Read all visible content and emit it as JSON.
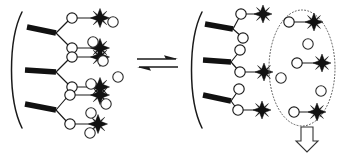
{
  "figure": {
    "colors": {
      "ink": "#111111",
      "outline": "#1a1a1a",
      "dotted": "#555555",
      "background": "#ffffff"
    }
  },
  "left_panel": {
    "name": "bound-state-complex",
    "membrane": {
      "label": "cell-membrane-arc",
      "x": 16,
      "top_y": 12,
      "bottom_y": 128,
      "bow": 14
    },
    "antibodies": [
      {
        "label": "antibody-left-1",
        "hinge_x": 56,
        "hinge_y": 33,
        "stem_x": 27,
        "stem_y": 27,
        "arms": [
          {
            "cx": 72,
            "cy": 18,
            "bound": true,
            "star_cx": 100,
            "star_cy": 18
          },
          {
            "cx": 72,
            "cy": 48,
            "bound": true,
            "star_cx": 100,
            "star_cy": 48
          }
        ]
      },
      {
        "label": "antibody-left-2",
        "hinge_x": 56,
        "hinge_y": 72,
        "stem_x": 25,
        "stem_y": 70,
        "arms": [
          {
            "cx": 72,
            "cy": 57,
            "bound": true,
            "star_cx": 100,
            "star_cy": 57
          },
          {
            "cx": 72,
            "cy": 87,
            "bound": true,
            "star_cx": 100,
            "star_cy": 87
          }
        ]
      },
      {
        "label": "antibody-left-3",
        "hinge_x": 56,
        "hinge_y": 110,
        "stem_x": 25,
        "stem_y": 104,
        "arms": [
          {
            "cx": 70,
            "cy": 95,
            "bound": true,
            "star_cx": 100,
            "star_cy": 95
          },
          {
            "cx": 70,
            "cy": 124,
            "bound": true,
            "star_cx": 98,
            "star_cy": 124
          }
        ]
      }
    ],
    "free_antigens": [
      {
        "cx": 111,
        "cy": 22,
        "r": 5
      },
      {
        "cx": 92,
        "cy": 42,
        "r": 5
      },
      {
        "cx": 101,
        "cy": 60,
        "r": 5
      },
      {
        "cx": 116,
        "cy": 76,
        "r": 5
      },
      {
        "cx": 90,
        "cy": 85,
        "r": 5
      },
      {
        "cx": 104,
        "cy": 103,
        "r": 5
      },
      {
        "cx": 90,
        "cy": 112,
        "r": 5
      },
      {
        "cx": 88,
        "cy": 115,
        "r": 5
      }
    ],
    "bound_count": 6,
    "free_count": 8
  },
  "equilibrium": {
    "name": "equilibrium-arrows",
    "x_start": 137,
    "x_end": 178,
    "top_y": 59,
    "bottom_y": 67,
    "forward_direction": "right",
    "reverse_direction": "left"
  },
  "right_panel": {
    "name": "released-state-complex",
    "membrane": {
      "label": "cell-membrane-arc",
      "x": 196,
      "top_y": 12,
      "bottom_y": 128,
      "bow": 14
    },
    "antibodies": [
      {
        "label": "antibody-right-1",
        "hinge_x": 233,
        "hinge_y": 29,
        "stem_x": 205,
        "stem_y": 24,
        "arms": [
          {
            "cx": 241,
            "cy": 14,
            "bound": true,
            "star_cx": 263,
            "star_cy": 14
          },
          {
            "cx": 243,
            "cy": 38,
            "bound": false
          }
        ]
      },
      {
        "label": "antibody-right-2",
        "hinge_x": 231,
        "hinge_y": 62,
        "stem_x": 203,
        "stem_y": 60,
        "arms": [
          {
            "cx": 240,
            "cy": 50,
            "bound": false
          },
          {
            "cx": 240,
            "cy": 72,
            "bound": true,
            "star_cx": 264,
            "star_cy": 72
          }
        ]
      },
      {
        "label": "antibody-right-3",
        "hinge_x": 231,
        "hinge_y": 101,
        "stem_x": 203,
        "stem_y": 95,
        "arms": [
          {
            "cx": 239,
            "cy": 89,
            "bound": false
          },
          {
            "cx": 238,
            "cy": 110,
            "bound": true,
            "star_cx": 262,
            "star_cy": 110
          }
        ]
      }
    ],
    "bound_count": 3,
    "free_count": 3
  },
  "release_zone": {
    "name": "released-antigen-compartment",
    "ellipse": {
      "cx": 302,
      "cy": 68,
      "rx": 33,
      "ry": 58
    },
    "complexes": [
      {
        "label": "complex-1",
        "circle_cx": 289,
        "circle_cy": 22,
        "star_cx": 314,
        "star_cy": 22
      },
      {
        "label": "complex-2",
        "circle_cx": 297,
        "circle_cy": 63,
        "star_cx": 322,
        "star_cy": 63
      },
      {
        "label": "complex-3",
        "circle_cx": 294,
        "circle_cy": 112,
        "star_cx": 317,
        "star_cy": 112
      }
    ],
    "free_antigens": [
      {
        "cx": 308,
        "cy": 44,
        "r": 5
      },
      {
        "cx": 281,
        "cy": 78,
        "r": 5
      },
      {
        "cx": 320,
        "cy": 91,
        "r": 5
      }
    ],
    "exit_arrow": {
      "label": "elution-down-arrow",
      "cx": 307,
      "top_y": 128,
      "bottom_y": 152,
      "shaft_half_width": 6,
      "head_half_width": 11
    }
  }
}
